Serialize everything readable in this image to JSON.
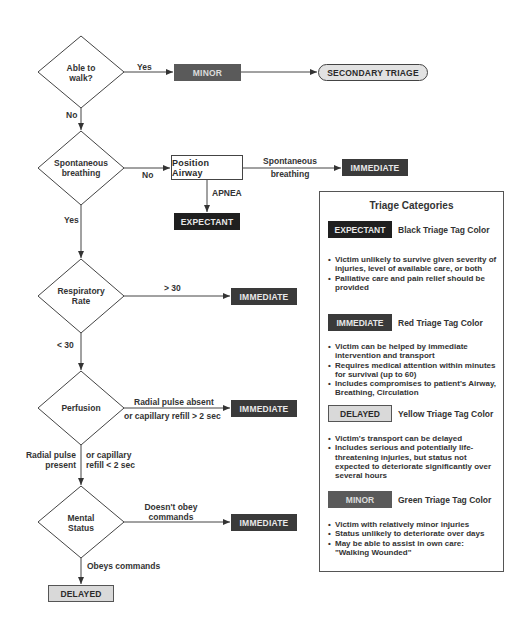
{
  "flowchart": {
    "decisions": [
      {
        "id": "walk",
        "label_line1": "Able to",
        "label_line2": "walk?"
      },
      {
        "id": "breathing",
        "label_line1": "Spontaneous",
        "label_line2": "breathing"
      },
      {
        "id": "resp",
        "label_line1": "Respiratory",
        "label_line2": "Rate"
      },
      {
        "id": "perfusion",
        "label_line1": "Perfusion",
        "label_line2": ""
      },
      {
        "id": "mental",
        "label_line1": "Mental",
        "label_line2": "Status"
      }
    ],
    "nodes": {
      "minor": "MINOR",
      "secondary_triage": "SECONDARY TRIAGE",
      "position_airway": "Position Airway",
      "immediate_breathing": "IMMEDIATE",
      "expectant": "EXPECTANT",
      "immediate_resp": "IMMEDIATE",
      "immediate_perfusion": "IMMEDIATE",
      "immediate_mental": "IMMEDIATE",
      "delayed": "DELAYED"
    },
    "edges": {
      "walk_yes": "Yes",
      "walk_no": "No",
      "breathing_no": "No",
      "breathing_yes": "Yes",
      "airway_spont_1": "Spontaneous",
      "airway_spont_2": "breathing",
      "airway_apnea": "APNEA",
      "resp_gt": "> 30",
      "resp_lt": "< 30",
      "perf_absent_1": "Radial pulse absent",
      "perf_absent_2": "or capillary refill > 2 sec",
      "perf_present_left_1": "Radial pulse",
      "perf_present_left_2": "present",
      "perf_present_right_1": "or capillary",
      "perf_present_right_2": "refill < 2 sec",
      "mental_not_1": "Doesn't obey",
      "mental_not_2": "commands",
      "mental_obeys": "Obeys commands"
    }
  },
  "legend": {
    "title": "Triage Categories",
    "categories": [
      {
        "tag": "EXPECTANT",
        "color_label": "Black Triage Tag Color",
        "bullets": [
          "Victim unlikely to survive given severity of injuries, level of available care, or both",
          "Palliative care and pain relief should be provided"
        ]
      },
      {
        "tag": "IMMEDIATE",
        "color_label": "Red Triage Tag Color",
        "bullets": [
          "Victim can be helped by immediate intervention and transport",
          "Requires medical attention within minutes for survival (up to 60)",
          "Includes compromises to patient's Airway, Breathing, Circulation"
        ]
      },
      {
        "tag": "DELAYED",
        "color_label": "Yellow Triage Tag Color",
        "bullets": [
          "Victim's transport can be delayed",
          "Includes serious and potentially life-threatening injuries, but status not expected to deteriorate significantly over several hours"
        ]
      },
      {
        "tag": "MINOR",
        "color_label": "Green Triage Tag Color",
        "bullets": [
          "Victim with relatively minor injuries",
          "Status unlikely to deteriorate over days",
          "May be able to assist in own care: \"Walking Wounded\""
        ]
      }
    ]
  },
  "colors": {
    "expectant": "#1f1f1f",
    "immediate": "#3a3a3a",
    "minor": "#5a5a5a",
    "delayed": "#d9d9d9",
    "line": "#444444"
  }
}
